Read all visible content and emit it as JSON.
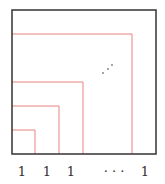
{
  "diagram": {
    "outer_box": {
      "x": 12,
      "y": 10,
      "size": 144,
      "color": "#333333"
    },
    "squares_color": "#e88080",
    "squares": [
      {
        "right": 35,
        "top": 130
      },
      {
        "right": 59,
        "top": 106
      },
      {
        "right": 83,
        "top": 82
      },
      {
        "right": 132,
        "top": 34
      }
    ],
    "dots": [
      {
        "x": 103,
        "y": 73
      },
      {
        "x": 108,
        "y": 69
      },
      {
        "x": 112,
        "y": 65
      }
    ],
    "labels": [
      {
        "text": "1",
        "x": 22
      },
      {
        "text": "1",
        "x": 47
      },
      {
        "text": "1",
        "x": 71
      },
      {
        "text": "· · ·",
        "x": 114
      },
      {
        "text": "1",
        "x": 145
      }
    ]
  }
}
